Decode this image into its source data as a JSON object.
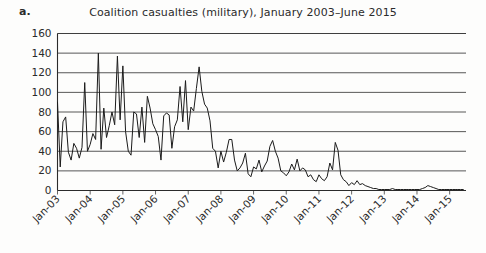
{
  "figure": {
    "panel_label": "a.",
    "title": "Coalition casualties (military), January 2003–June 2015"
  },
  "chart_data": {
    "type": "line",
    "title": "Coalition casualties (military), January 2003–June 2015",
    "xlabel": "",
    "ylabel": "",
    "ylim": [
      0,
      160
    ],
    "ytick_labels": [
      "160",
      "140",
      "120",
      "100",
      "80",
      "60",
      "40",
      "20",
      "0"
    ],
    "yticks": [
      160,
      140,
      120,
      100,
      80,
      60,
      40,
      20,
      0
    ],
    "grid": true,
    "legend": "none",
    "xtick_labels": [
      "Jan-03",
      "Jan-04",
      "Jan-05",
      "Jan-06",
      "Jan-07",
      "Jan-08",
      "Jan-09",
      "Jan-10",
      "Jan-11",
      "Jan-12",
      "Jan-13",
      "Jan-14",
      "Jan-15"
    ],
    "x_start": "Jan-03",
    "x_end": "Jun-15",
    "x_unit": "month",
    "series": [
      {
        "name": "Coalition casualties (military)",
        "color": "#1b1b1b",
        "values": [
          90,
          24,
          70,
          75,
          39,
          31,
          48,
          43,
          33,
          44,
          110,
          40,
          47,
          58,
          52,
          140,
          42,
          84,
          54,
          66,
          80,
          67,
          137,
          72,
          127,
          60,
          40,
          36,
          80,
          78,
          54,
          85,
          49,
          96,
          84,
          68,
          62,
          55,
          31,
          76,
          79,
          77,
          43,
          65,
          72,
          106,
          70,
          112,
          62,
          85,
          81,
          104,
          126,
          101,
          88,
          84,
          71,
          43,
          40,
          23,
          40,
          29,
          39,
          52,
          52,
          31,
          20,
          23,
          28,
          38,
          17,
          14,
          24,
          22,
          31,
          19,
          25,
          30,
          45,
          51,
          40,
          33,
          20,
          18,
          15,
          19,
          27,
          21,
          32,
          20,
          23,
          21,
          14,
          16,
          11,
          9,
          16,
          12,
          10,
          14,
          28,
          21,
          49,
          41,
          16,
          11,
          9,
          5,
          8,
          6,
          10,
          6,
          7,
          5,
          4,
          3,
          2,
          2,
          1,
          1,
          1,
          1,
          1,
          2,
          1,
          1,
          1,
          1,
          1,
          1,
          1,
          1,
          1,
          1,
          2,
          3,
          5,
          4,
          3,
          2,
          1,
          1,
          1,
          1,
          1,
          1,
          1,
          1,
          1,
          1
        ]
      }
    ]
  }
}
